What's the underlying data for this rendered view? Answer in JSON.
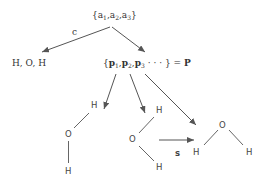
{
  "diagram": {
    "root": {
      "label": "{a",
      "parts": [
        "{a",
        "1",
        ",a",
        "2",
        ",a",
        "3",
        "}"
      ]
    },
    "left_child": {
      "label": "H, O, H",
      "edge_label": "c"
    },
    "right_child": {
      "parts": [
        "{",
        "p",
        "1",
        ",",
        "p",
        "2",
        ",",
        "p",
        "3",
        " · · · }",
        " = ",
        "P"
      ]
    },
    "molecules": [
      {
        "atoms": [
          "H",
          "O",
          "H"
        ],
        "arrangement": "bent-vertical"
      },
      {
        "atoms": [
          "H",
          "O",
          "H"
        ],
        "arrangement": "bent-right"
      },
      {
        "atoms": [
          "H",
          "O",
          "H"
        ],
        "arrangement": "bent-v"
      }
    ],
    "transition": {
      "label": "s"
    },
    "colors": {
      "text": "#333333",
      "lines": "#555555",
      "background": "#ffffff"
    }
  }
}
